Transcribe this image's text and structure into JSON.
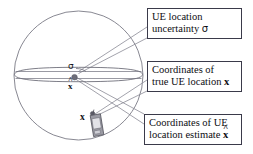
{
  "figure": {
    "type": "annotated-diagram"
  },
  "callouts": [
    {
      "id": "uncertainty",
      "name": "callout-ue-location-uncertainty",
      "line1": "UE location",
      "line2_prefix": "uncertainty ",
      "line2_symbol": "σ"
    },
    {
      "id": "true_location",
      "name": "callout-true-ue-location",
      "line1": "Coordinates of",
      "line2_prefix": "true UE location ",
      "line2_symbol": "x"
    },
    {
      "id": "location_estimate",
      "name": "callout-ue-location-estimate",
      "line1": "Coordinates of UE",
      "line2_prefix": "location estimate ",
      "line2_symbol": "x",
      "line2_accent": "^"
    }
  ],
  "labels": {
    "sigma": "σ",
    "x_hat_base": "x",
    "x_hat_accent": "^",
    "x_true": "x"
  },
  "shapes": {
    "coverage_circle": "cell-coverage-circle",
    "uncertainty_ellipse": "location-uncertainty-ellipse",
    "estimate_point": "estimate-point-marker",
    "true_point": "true-location-marker",
    "device": "mobile-handset-icon"
  },
  "colors": {
    "stroke": "#6b6b77",
    "box_border": "#3a3a4a",
    "text": "#0d0d12",
    "leader": "#8a8a96",
    "device_body": "#8e8e98",
    "device_screen": "#d9d9de"
  }
}
